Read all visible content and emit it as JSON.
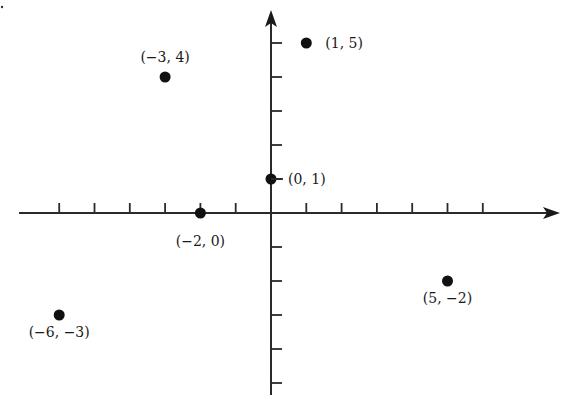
{
  "chart_data": {
    "type": "scatter",
    "title": "",
    "xlabel": "",
    "ylabel": "",
    "xlim": [
      -7,
      8
    ],
    "ylim": [
      -5,
      6
    ],
    "grid": false,
    "x_ticks": [
      -6,
      -5,
      -4,
      -3,
      -2,
      -1,
      1,
      2,
      3,
      4,
      5,
      6
    ],
    "y_ticks": [
      -5,
      -4,
      -3,
      -2,
      -1,
      1,
      2,
      3,
      4,
      5
    ],
    "points": [
      {
        "x": -3,
        "y": 4,
        "label": "(−3, 4)"
      },
      {
        "x": 1,
        "y": 5,
        "label": "(1, 5)"
      },
      {
        "x": 0,
        "y": 1,
        "label": "(0, 1)"
      },
      {
        "x": -2,
        "y": 0,
        "label": "(−2, 0)"
      },
      {
        "x": 5,
        "y": -2,
        "label": "(5, −2)"
      },
      {
        "x": -6,
        "y": -3,
        "label": "(−6, −3)"
      }
    ]
  },
  "colors": {
    "axis": "#2a2a2a",
    "point": "#111111",
    "background": "#ffffff"
  }
}
